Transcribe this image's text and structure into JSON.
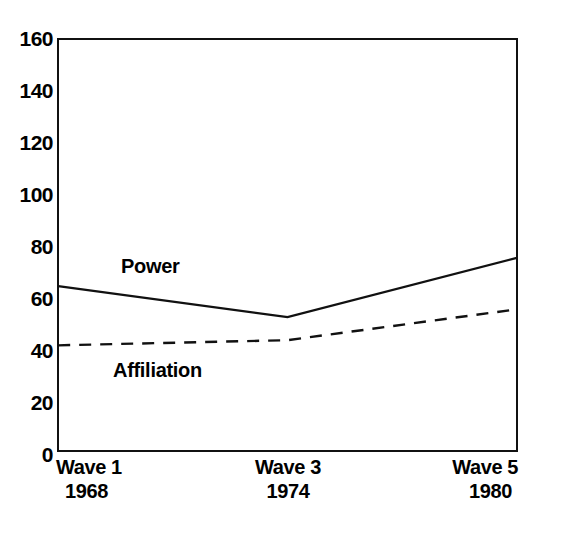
{
  "chart_data": {
    "type": "line",
    "title": "",
    "xlabel": "",
    "ylabel": "",
    "ylim": [
      0,
      160
    ],
    "grid": false,
    "legend_position": "inline-annotation",
    "categories": [
      "Wave 1",
      "Wave 3",
      "Wave 5"
    ],
    "x_tick_labels": [
      {
        "wave": "Wave 1",
        "year": "1968"
      },
      {
        "wave": "Wave 3",
        "year": "1974"
      },
      {
        "wave": "Wave 5",
        "year": "1980"
      }
    ],
    "y_tick_labels": [
      "160",
      "140",
      "120",
      "100",
      "80",
      "60",
      "40",
      "20",
      "0"
    ],
    "y_ticks": [
      160,
      140,
      120,
      100,
      80,
      60,
      40,
      20,
      0
    ],
    "series": [
      {
        "name": "Power",
        "style": "solid",
        "color": "#111111",
        "values": [
          64,
          52,
          75
        ]
      },
      {
        "name": "Affiliation",
        "style": "dashed",
        "color": "#111111",
        "values": [
          41,
          43,
          55
        ]
      }
    ],
    "annotations": [
      {
        "text": "Power",
        "series": "Power"
      },
      {
        "text": "Affiliation",
        "series": "Affiliation"
      }
    ]
  },
  "labels": {
    "power": "Power",
    "affiliation": "Affiliation"
  }
}
